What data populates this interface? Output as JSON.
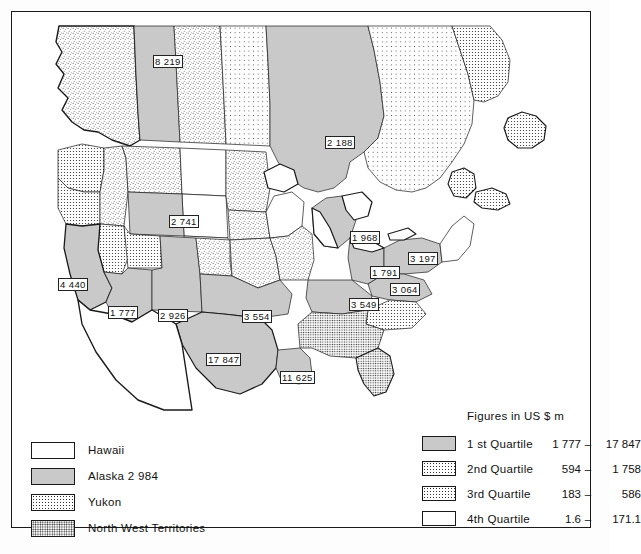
{
  "figure": {
    "type": "choropleth-map",
    "region": "North America (United States and Canada)",
    "units_note": "Figures in US $ m"
  },
  "map_labels": [
    {
      "id": "label-8219",
      "value": "8 219",
      "x": 141,
      "y": 43,
      "boxed": true
    },
    {
      "id": "label-2188",
      "value": "2 188",
      "x": 313,
      "y": 124,
      "boxed": true
    },
    {
      "id": "label-2741",
      "value": "2 741",
      "x": 157,
      "y": 203,
      "boxed": true
    },
    {
      "id": "label-1968",
      "value": "1 968",
      "x": 338,
      "y": 219,
      "boxed": true
    },
    {
      "id": "label-3197",
      "value": "3 197",
      "x": 396,
      "y": 240,
      "boxed": true
    },
    {
      "id": "label-1791",
      "value": "1 791",
      "x": 358,
      "y": 254,
      "boxed": true
    },
    {
      "id": "label-3064",
      "value": "3 064",
      "x": 378,
      "y": 271,
      "boxed": true
    },
    {
      "id": "label-4440",
      "value": "4 440",
      "x": 46,
      "y": 266,
      "boxed": true
    },
    {
      "id": "label-3549",
      "value": "3 549",
      "x": 337,
      "y": 286,
      "boxed": true
    },
    {
      "id": "label-1777",
      "value": "1 777",
      "x": 96,
      "y": 294,
      "boxed": true
    },
    {
      "id": "label-2926",
      "value": "2 926",
      "x": 146,
      "y": 297,
      "boxed": true
    },
    {
      "id": "label-3554",
      "value": "3 554",
      "x": 230,
      "y": 298,
      "boxed": true
    },
    {
      "id": "label-17847",
      "value": "17 847",
      "x": 194,
      "y": 341,
      "boxed": true
    },
    {
      "id": "label-11625",
      "value": "11 625",
      "x": 268,
      "y": 359,
      "boxed": true
    }
  ],
  "legend_left": {
    "items": [
      {
        "label": "Hawaii",
        "fill": "white"
      },
      {
        "label": "Alaska  2 984",
        "fill": "gray"
      },
      {
        "label": "Yukon",
        "fill": "dots-fine"
      },
      {
        "label": "North West Territories",
        "fill": "dots-coarse"
      }
    ]
  },
  "legend_right": {
    "units": "Figures in US $ m",
    "items": [
      {
        "name": "1 st Quartile",
        "low": "1 777",
        "dash": "–",
        "high": "17 847",
        "fill": "gray"
      },
      {
        "name": "2nd Quartile",
        "low": "594",
        "dash": "–",
        "high": "1 758",
        "fill": "dots-sparse"
      },
      {
        "name": "3rd Quartile",
        "low": "183",
        "dash": "–",
        "high": "586",
        "fill": "dots-fine"
      },
      {
        "name": "4th Quartile",
        "low": "1.6",
        "dash": "–",
        "high": "171.1",
        "fill": "white"
      }
    ]
  },
  "chart_data": {
    "type": "map",
    "title": "",
    "ylabel": "",
    "xlabel": "",
    "units": "US $ m",
    "categories": [
      "Alberta/BC region",
      "Ontario",
      "Colorado/Wyoming",
      "Michigan",
      "Pennsylvania",
      "Ohio",
      "Virginia",
      "California",
      "Kentucky/Tennessee",
      "Arizona",
      "New Mexico",
      "Oklahoma/Arkansas",
      "Texas",
      "Louisiana",
      "Alaska"
    ],
    "values": [
      8219,
      2188,
      2741,
      1968,
      3197,
      1791,
      3064,
      4440,
      3549,
      1777,
      2926,
      3554,
      17847,
      11625,
      2984
    ],
    "classes": [
      {
        "name": "1 st Quartile",
        "range": [
          1777,
          17847
        ],
        "style": "solid gray"
      },
      {
        "name": "2nd Quartile",
        "range": [
          594,
          1758
        ],
        "style": "sparse dots"
      },
      {
        "name": "3rd Quartile",
        "range": [
          183,
          586
        ],
        "style": "fine dots"
      },
      {
        "name": "4th Quartile",
        "range": [
          1.6,
          171.1
        ],
        "style": "white"
      }
    ],
    "legend_position": "bottom",
    "grid": false
  }
}
